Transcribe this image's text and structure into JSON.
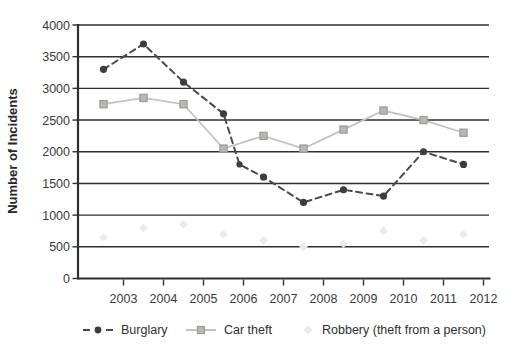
{
  "figure": {
    "background": "#ffffff",
    "ink_color": "#2f2f31",
    "label_color": "#3a3a3c"
  },
  "chart_data": {
    "type": "line",
    "title": "",
    "xlabel": "",
    "ylabel": "Number of Incidents",
    "ylim": [
      0,
      4000
    ],
    "ytick_step": 500,
    "yticks": [
      "0",
      "500",
      "1000",
      "1500",
      "2000",
      "2500",
      "3000",
      "3500",
      "4000"
    ],
    "categories": [
      "2003",
      "2004",
      "2005",
      "2006",
      "2007",
      "2008",
      "2009",
      "2010",
      "2011",
      "2012"
    ],
    "grid": "horizontal gridlines on, dark",
    "legend_position": "bottom",
    "series": [
      {
        "name": "Burglary",
        "line_style": "dashed",
        "marker": "circle",
        "color": "#4a4a4c",
        "marker_color": "#3d3d3f",
        "values": [
          3300,
          3700,
          3100,
          2600,
          1600,
          1200,
          1400,
          1300,
          2000,
          1800
        ],
        "extra_points": [
          {
            "after_index": 3,
            "x_offset": 0.4,
            "value": 1800
          }
        ]
      },
      {
        "name": "Car theft",
        "line_style": "solid",
        "marker": "square",
        "color": "#c1c4be",
        "marker_color": "#b6b9b3",
        "marker_border": "#999c96",
        "values": [
          2750,
          2850,
          2750,
          2050,
          2250,
          2050,
          2350,
          2650,
          2500,
          2300
        ],
        "extra_points": []
      },
      {
        "name": "Robbery (theft from a person)",
        "line_style": "none",
        "marker": "diamond",
        "color": "#eaeae6",
        "marker_color": "#eaeae6",
        "values": [
          650,
          800,
          850,
          700,
          600,
          500,
          550,
          750,
          600,
          700
        ],
        "extra_points": []
      }
    ]
  }
}
